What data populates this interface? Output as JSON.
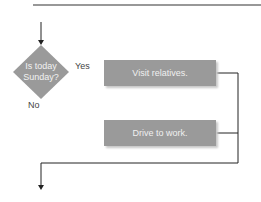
{
  "flowchart": {
    "decision": {
      "line1": "Is today",
      "line2": "Sunday?"
    },
    "branch_labels": {
      "yes": "Yes",
      "no": "No"
    },
    "processes": [
      {
        "label": "Visit relatives."
      },
      {
        "label": "Drive to work."
      }
    ],
    "colors": {
      "shape_fill": "#9a9a9a",
      "line": "#222222",
      "text_on_shape": "#f0f0f0"
    }
  }
}
